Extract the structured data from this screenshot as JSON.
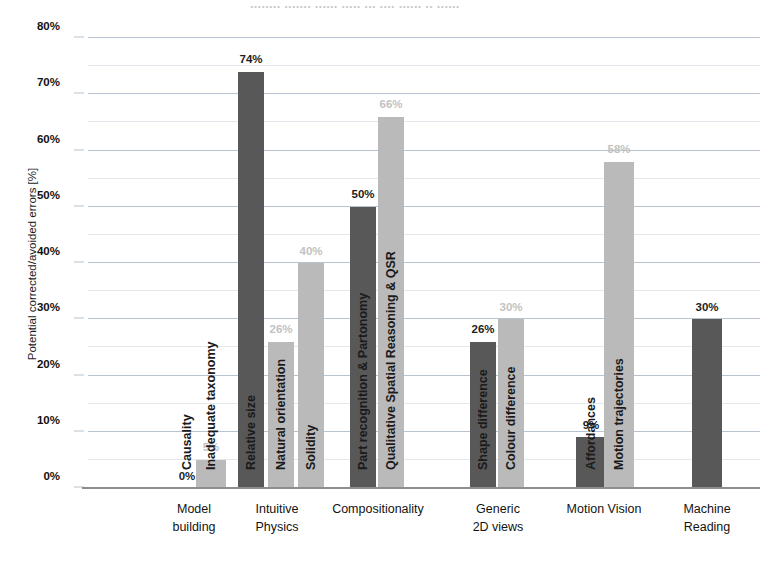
{
  "title_remnant": "........ ....... ......  .....  ...  ....  ......  ..  ......",
  "chart_data": {
    "type": "bar",
    "title": "",
    "xlabel": "",
    "ylabel": "Potential corrected/avoided errors [%]",
    "ylim": [
      0,
      80
    ],
    "ytick_labels": [
      "0%",
      "10%",
      "20%",
      "30%",
      "40%",
      "50%",
      "60%",
      "70%",
      "80%"
    ],
    "ytick_values": [
      0,
      10,
      20,
      30,
      40,
      50,
      60,
      70,
      80
    ],
    "grid": true,
    "grid_minor_step": 5,
    "legend": "none",
    "colors": {
      "dark": "#585858",
      "light": "#bababa",
      "gridline": "#b9c4d2",
      "axis": "#8d8d8d"
    },
    "categories": [
      "Model building",
      "Intuitive Physics",
      "Compositionality",
      "Generic 2D views",
      "Motion Vision",
      "Machine Reading"
    ],
    "groups": [
      {
        "category": "Model building",
        "category_lines": [
          "Model",
          "building"
        ],
        "bars": [
          {
            "label": "Causality",
            "value": 0,
            "value_label": "0%",
            "shade": "dark"
          },
          {
            "label": "Inadequate taxonomy",
            "value": 5,
            "value_label": "5%",
            "shade": "light"
          }
        ]
      },
      {
        "category": "Intuitive Physics",
        "category_lines": [
          "Intuitive",
          "Physics"
        ],
        "bars": [
          {
            "label": "Relative size",
            "value": 74,
            "value_label": "74%",
            "shade": "dark"
          },
          {
            "label": "Natural orientation",
            "value": 26,
            "value_label": "26%",
            "shade": "light"
          },
          {
            "label": "Solidity",
            "value": 40,
            "value_label": "40%",
            "shade": "light"
          }
        ]
      },
      {
        "category": "Compositionality",
        "category_lines": [
          "Compositionality"
        ],
        "bars": [
          {
            "label": "Part recognition & Partonomy",
            "value": 50,
            "value_label": "50%",
            "shade": "dark"
          },
          {
            "label": "Qualitative Spatial Reasoning & QSR",
            "value": 66,
            "value_label": "66%",
            "shade": "light"
          }
        ]
      },
      {
        "category": "Generic 2D views",
        "category_lines": [
          "Generic",
          "2D views"
        ],
        "bars": [
          {
            "label": "Shape difference",
            "value": 26,
            "value_label": "26%",
            "shade": "dark"
          },
          {
            "label": "Colour difference",
            "value": 30,
            "value_label": "30%",
            "shade": "light"
          }
        ]
      },
      {
        "category": "Motion Vision",
        "category_lines": [
          "Motion Vision"
        ],
        "bars": [
          {
            "label": "Affordances",
            "value": 9,
            "value_label": "9%",
            "shade": "dark"
          },
          {
            "label": "Motion trajectories",
            "value": 58,
            "value_label": "58%",
            "shade": "light"
          }
        ]
      },
      {
        "category": "Machine Reading",
        "category_lines": [
          "Machine",
          "Reading"
        ],
        "bars": [
          {
            "label": "",
            "value": 30,
            "value_label": "30%",
            "shade": "dark"
          }
        ]
      }
    ]
  }
}
